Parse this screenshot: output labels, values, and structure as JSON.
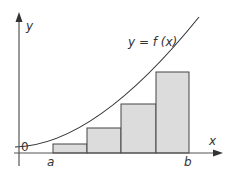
{
  "diagram": {
    "labels": {
      "y_axis": "y",
      "x_axis": "x",
      "origin": "0",
      "curve": "y = f (x)",
      "a": "a",
      "b": "b"
    },
    "colors": {
      "axis": "#555555",
      "curve": "#333333",
      "bar_fill": "#dcdcdc",
      "bar_stroke": "#444444",
      "text": "#333333"
    },
    "rectangles": [
      {
        "index": 1,
        "x0": 53,
        "x1": 87,
        "top": 144
      },
      {
        "index": 2,
        "x0": 87,
        "x1": 121,
        "top": 128
      },
      {
        "index": 3,
        "x0": 121,
        "x1": 156,
        "top": 104
      },
      {
        "index": 4,
        "x0": 156,
        "x1": 189,
        "top": 72
      }
    ],
    "rectangle_count": 4
  }
}
